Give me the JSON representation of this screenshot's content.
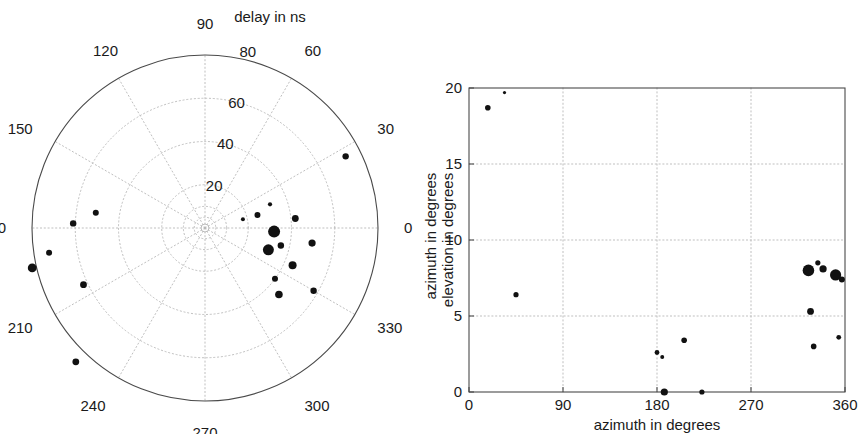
{
  "figure": {
    "name": "radio-source-localization-figure",
    "panel_count": 2
  },
  "chart_data": [
    {
      "type": "scatter",
      "projection": "polar",
      "title": "delay in ns",
      "xlabel": "",
      "ylabel": "",
      "angular_label": "azimuth in degrees",
      "radial_label": "delay in ns",
      "angular_ticks": [
        0,
        30,
        60,
        90,
        120,
        150,
        180,
        210,
        240,
        270,
        300,
        330
      ],
      "angular_tick_labels": [
        "0",
        "30",
        "60",
        "90",
        "120",
        "150",
        "180",
        "210",
        "240",
        "270",
        "300",
        "330"
      ],
      "radial_ticks": [
        20,
        40,
        60,
        80
      ],
      "radial_tick_labels": [
        "20",
        "40",
        "60",
        "80"
      ],
      "radial_tick_label_angle": 75,
      "rlim": [
        0,
        80
      ],
      "theta_direction": "counterclockwise",
      "theta_zero_location": "E",
      "grid": true,
      "legend": "none",
      "marker_color": "#111111",
      "points": [
        {
          "theta": 27,
          "r": 73,
          "size": 3.2
        },
        {
          "theta": 20,
          "r": 32,
          "size": 2.1
        },
        {
          "theta": 14,
          "r": 25,
          "size": 3.0
        },
        {
          "theta": 6,
          "r": 42,
          "size": 3.4
        },
        {
          "theta": 357,
          "r": 32,
          "size": 6.0
        },
        {
          "theta": 352,
          "r": 50,
          "size": 3.6
        },
        {
          "theta": 347,
          "r": 36,
          "size": 3.2
        },
        {
          "theta": 341,
          "r": 31,
          "size": 5.5
        },
        {
          "theta": 337,
          "r": 44,
          "size": 4.0
        },
        {
          "theta": 330,
          "r": 58,
          "size": 3.2
        },
        {
          "theta": 324,
          "r": 40,
          "size": 3.0
        },
        {
          "theta": 318,
          "r": 46,
          "size": 3.8
        },
        {
          "theta": 178,
          "r": 61,
          "size": 3.2
        },
        {
          "theta": 172,
          "r": 51,
          "size": 3.0
        },
        {
          "theta": 189,
          "r": 73,
          "size": 3.0
        },
        {
          "theta": 193,
          "r": 82,
          "size": 4.4
        },
        {
          "theta": 205,
          "r": 62,
          "size": 3.4
        },
        {
          "theta": 226,
          "r": 86,
          "size": 3.4
        },
        {
          "theta": 13,
          "r": 18,
          "size": 2.0
        }
      ]
    },
    {
      "type": "scatter",
      "projection": "cartesian",
      "title": "",
      "xlabel": "azimuth in degrees",
      "ylabel": "elevation in degrees",
      "secondary_ylabel": "azimuth in degrees",
      "xticks": [
        0,
        90,
        180,
        270,
        360
      ],
      "xtick_labels": [
        "0",
        "90",
        "180",
        "270",
        "360"
      ],
      "yticks": [
        0,
        5,
        10,
        15,
        20
      ],
      "ytick_labels": [
        "0",
        "5",
        "10",
        "15",
        "20"
      ],
      "xlim": [
        0,
        360
      ],
      "ylim": [
        0,
        20
      ],
      "grid": true,
      "legend": "none",
      "marker_color": "#111111",
      "points": [
        {
          "x": 18,
          "y": 18.7,
          "size": 2.8
        },
        {
          "x": 34,
          "y": 19.7,
          "size": 1.6
        },
        {
          "x": 45,
          "y": 6.4,
          "size": 2.6
        },
        {
          "x": 180,
          "y": 2.6,
          "size": 2.4
        },
        {
          "x": 185,
          "y": 2.3,
          "size": 2.0
        },
        {
          "x": 187,
          "y": 0.0,
          "size": 3.6
        },
        {
          "x": 206,
          "y": 3.4,
          "size": 2.8
        },
        {
          "x": 223,
          "y": 0.0,
          "size": 2.6
        },
        {
          "x": 325,
          "y": 8.0,
          "size": 5.8
        },
        {
          "x": 334,
          "y": 8.5,
          "size": 2.6
        },
        {
          "x": 339,
          "y": 8.1,
          "size": 3.6
        },
        {
          "x": 351,
          "y": 7.7,
          "size": 5.6
        },
        {
          "x": 357,
          "y": 7.4,
          "size": 3.0
        },
        {
          "x": 327,
          "y": 5.3,
          "size": 3.4
        },
        {
          "x": 354,
          "y": 3.6,
          "size": 2.4
        },
        {
          "x": 330,
          "y": 3.0,
          "size": 2.8
        }
      ]
    }
  ]
}
